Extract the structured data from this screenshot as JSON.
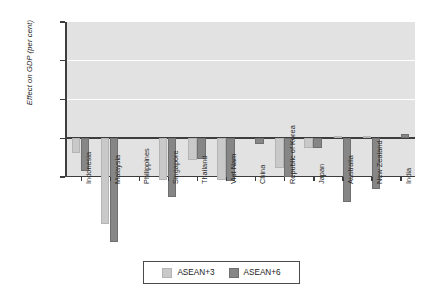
{
  "chart_data": {
    "type": "bar",
    "title": "",
    "xlabel": "",
    "ylabel": "Effect on GDP (per cent)",
    "ylim": [
      -0.5,
      1.5
    ],
    "yticks": [
      "1.5",
      "1.0",
      "0.5",
      "0.0",
      "-0.5"
    ],
    "ytick_values": [
      1.5,
      1.0,
      0.5,
      0.0,
      -0.5
    ],
    "grid": "horizontal-white-gridlines",
    "legend_position": "bottom-center",
    "categories": [
      "Indonesia",
      "Malaysia",
      "Philippines",
      "Singapore",
      "Thailand",
      "Viet Nam",
      "China",
      "Republic of Korea",
      "Japan",
      "Australia",
      "New Zealand",
      "India"
    ],
    "series": [
      {
        "name": "ASEAN+3",
        "color": "#c9c9c9",
        "values": [
          0.19,
          1.1,
          0.0,
          0.54,
          0.28,
          0.54,
          0.0,
          0.39,
          0.12,
          -0.03,
          -0.02,
          0.0
        ]
      },
      {
        "name": "ASEAN+6",
        "color": "#868686",
        "values": [
          0.42,
          1.34,
          0.0,
          0.76,
          0.27,
          0.55,
          0.08,
          0.5,
          0.13,
          0.82,
          0.66,
          -0.05
        ]
      }
    ]
  },
  "legend": {
    "entries": [
      {
        "label": "ASEAN+3"
      },
      {
        "label": "ASEAN+6"
      }
    ]
  },
  "axis": {
    "y_title": "Effect on GDP (per cent)"
  }
}
